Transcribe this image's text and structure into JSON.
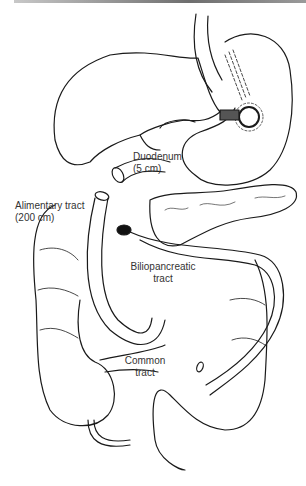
{
  "figure": {
    "labels": {
      "duodenum": {
        "line1": "Duodenum",
        "line2": "(5 cm)"
      },
      "alimentary": {
        "line1": "Alimentary tract",
        "line2": "(200 cm)"
      },
      "biliopancreatic": {
        "line1": "Biliopancreatic",
        "line2": "tract"
      },
      "common": {
        "line1": "Common",
        "line2": "tract"
      }
    },
    "colors": {
      "line": "#1a1a1a",
      "text": "#333333",
      "topbar": "#6e6e6e"
    }
  }
}
